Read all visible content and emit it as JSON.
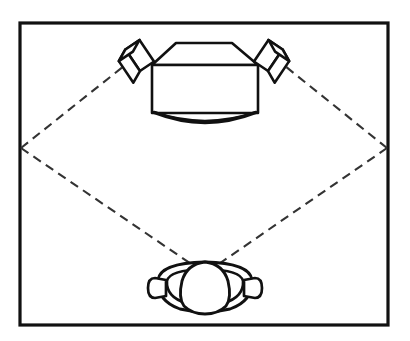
{
  "figure": {
    "title": "Top-down diagram of a display with two loudspeakers and a headphone listener",
    "caption": "",
    "background_color": "#ffffff",
    "line_color": "#111111",
    "dash_color": "#333333",
    "canvas": {
      "width": 410,
      "height": 341
    }
  },
  "frame": {
    "name": "outer-border",
    "x": 20,
    "y": 23,
    "width": 368,
    "height": 302,
    "stroke_width": 3.2
  },
  "display": {
    "name": "television-top-view",
    "body": {
      "x": 152,
      "y": 65,
      "width": 106,
      "height": 48
    },
    "bezel_trapezoid": {
      "top_left_x": 176,
      "top_right_x": 232,
      "top_y": 43,
      "bottom_left_x": 152,
      "bottom_right_x": 258,
      "bottom_y": 65
    },
    "curved_front": {
      "left_x": 154,
      "right_x": 256,
      "y": 113,
      "bulge_y": 124
    },
    "stroke_width": 2.6
  },
  "speakers": [
    {
      "name": "left-speaker",
      "label": "",
      "center_x": 136,
      "center_y": 58,
      "rotation_deg": -34
    },
    {
      "name": "right-speaker",
      "label": "",
      "center_x": 272,
      "center_y": 58,
      "rotation_deg": 34
    }
  ],
  "listener": {
    "name": "listener-head-with-headphones",
    "head": {
      "cx": 205,
      "cy": 285,
      "rx": 23,
      "ry": 27
    },
    "headband": {
      "cx": 205,
      "cy": 284,
      "rx": 47,
      "ry": 25
    },
    "left_earcup": {
      "cx": 161,
      "cy": 287,
      "rx": 8,
      "ry": 11
    },
    "right_earcup": {
      "cx": 249,
      "cy": 287,
      "rx": 8,
      "ry": 11
    },
    "stroke_width": 2.8
  },
  "sound_field": {
    "name": "dashed-diamond",
    "description": "Dashed rays from the listener position to the left and right frame edges and up to the speakers",
    "apex_top_left": {
      "x": 129,
      "y": 62
    },
    "apex_top_right": {
      "x": 280,
      "y": 62
    },
    "vertex_left": {
      "x": 21,
      "y": 148
    },
    "vertex_right": {
      "x": 387,
      "y": 148
    },
    "apex_bottom": {
      "x": 205,
      "y": 263
    },
    "dash_length": 9,
    "dash_gap": 6,
    "stroke_width": 2.1
  }
}
